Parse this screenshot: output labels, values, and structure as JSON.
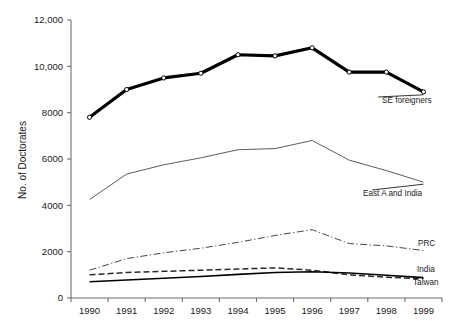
{
  "chart_data": {
    "type": "line",
    "title": "",
    "xlabel": "",
    "ylabel": "No. of Doctorates",
    "x": [
      1990,
      1991,
      1992,
      1993,
      1994,
      1995,
      1996,
      1997,
      1998,
      1999
    ],
    "categories": [
      "1990",
      "1991",
      "1992",
      "1993",
      "1994",
      "1995",
      "1996",
      "1997",
      "1998",
      "1999"
    ],
    "ylim": [
      0,
      12000
    ],
    "yticks": [
      0,
      2000,
      4000,
      6000,
      8000,
      10000,
      12000
    ],
    "ytick_labels": [
      "0",
      "2000",
      "4000",
      "6000",
      "8000",
      "10,000",
      "12,000"
    ],
    "grid": false,
    "legend_position": "right-inline-labels",
    "series": [
      {
        "name": "SE foreigners",
        "label": "SE foreigners",
        "style": "solid-thick-markers",
        "color": "#000000",
        "values": [
          7800,
          9000,
          9500,
          9700,
          10500,
          10450,
          10800,
          9750,
          9750,
          8900
        ]
      },
      {
        "name": "East A and India",
        "label": "East A and India",
        "style": "solid-thin",
        "color": "#4a4a4a",
        "values": [
          4250,
          5350,
          5750,
          6050,
          6400,
          6450,
          6800,
          5950,
          5500,
          5000
        ]
      },
      {
        "name": "PRC",
        "label": "PRC",
        "style": "dash-dot",
        "color": "#3c3c3c",
        "values": [
          1200,
          1700,
          1950,
          2150,
          2400,
          2700,
          2950,
          2350,
          2250,
          2050
        ]
      },
      {
        "name": "India",
        "label": "India",
        "style": "dashed",
        "color": "#2a2a2a",
        "values": [
          1000,
          1100,
          1150,
          1200,
          1250,
          1300,
          1200,
          1000,
          900,
          830
        ]
      },
      {
        "name": "Taiwan",
        "label": "Taiwan",
        "style": "solid-medium",
        "color": "#000000",
        "values": [
          700,
          780,
          850,
          930,
          1020,
          1100,
          1130,
          1080,
          980,
          880
        ]
      }
    ]
  },
  "axis": {
    "y_title": "No. of Doctorates"
  }
}
